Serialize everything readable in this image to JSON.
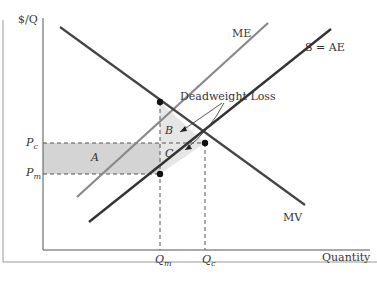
{
  "diagram": {
    "y_axis_label": "$/Q",
    "x_axis_label": "Quantity",
    "curves": {
      "me": "ME",
      "mv": "MV",
      "ae": "S = AE"
    },
    "price_labels": {
      "pc": "P",
      "pc_sub": "c",
      "pm": "P",
      "pm_sub": "m"
    },
    "quantity_labels": {
      "qm": "Q",
      "qm_sub": "m",
      "qc": "Q",
      "qc_sub": "c"
    },
    "regions": {
      "a": "A",
      "b": "B",
      "c": "C"
    },
    "annotation": "Deadweight Loss",
    "colors": {
      "line_dark": "#333333",
      "line_gray": "#888888",
      "shade": "#d4d4d4",
      "shade_light": "#e6e6e6"
    }
  }
}
